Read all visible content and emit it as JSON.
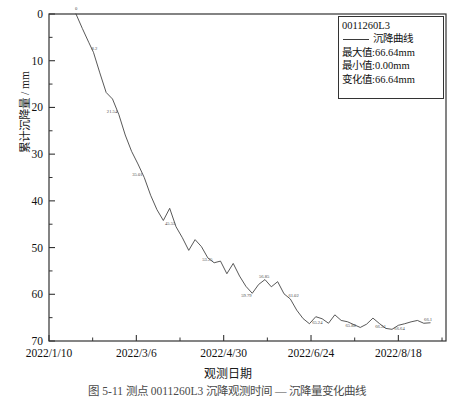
{
  "chart_data": {
    "type": "line",
    "title": "",
    "xlabel": "观测日期",
    "ylabel": "累计沉降量 / mm",
    "y_inverted": true,
    "ylim": [
      0,
      70
    ],
    "grid": false,
    "y_ticks": [
      "0",
      "10",
      "20",
      "30",
      "40",
      "50",
      "60",
      "70"
    ],
    "y_tick_values": [
      0,
      10,
      20,
      30,
      40,
      50,
      60,
      70
    ],
    "x_ticks": [
      "2022/1/10",
      "2022/3/6",
      "2022/4/30",
      "2022/6/24",
      "2022/8/18"
    ],
    "x_tick_days": [
      0,
      55,
      110,
      165,
      220
    ],
    "x_range_days": [
      0,
      250
    ],
    "series": [
      {
        "name": "沉降曲线",
        "color": "#3a3a3a",
        "x": [
          17,
          21,
          25,
          28,
          32,
          36,
          40,
          44,
          48,
          52,
          56,
          60,
          64,
          68,
          72,
          76,
          80,
          84,
          88,
          92,
          96,
          100,
          104,
          108,
          112,
          116,
          120,
          124,
          128,
          132,
          136,
          140,
          144,
          148,
          152,
          156,
          160,
          164,
          168,
          172,
          176,
          180,
          184,
          188,
          192,
          196,
          200,
          204,
          208,
          212,
          216,
          220,
          224,
          228,
          232,
          236,
          240
        ],
        "values": [
          0.0,
          3.1,
          6.05,
          8.2,
          12.6,
          16.8,
          18.2,
          21.54,
          25.9,
          29.4,
          32.1,
          35.01,
          38.8,
          41.9,
          44.2,
          41.6,
          45.55,
          47.9,
          50.6,
          48.3,
          49.8,
          52.2,
          53.25,
          52.9,
          55.6,
          53.4,
          56.1,
          58.3,
          59.79,
          57.9,
          56.85,
          58.4,
          57.3,
          59.9,
          61.02,
          63.4,
          65.2,
          66.3,
          64.8,
          65.24,
          66.2,
          64.4,
          65.6,
          65.88,
          66.5,
          67.1,
          66.4,
          65.1,
          66.24,
          67.3,
          67.5,
          66.64,
          66.3,
          65.9,
          65.6,
          66.2,
          66.1
        ]
      }
    ],
    "point_labels": [
      {
        "text": "0",
        "x": 17,
        "y": 0.0,
        "dx": -1,
        "dy": -4
      },
      {
        "text": "8.2",
        "x": 28,
        "y": 8.2,
        "dx": -2,
        "dy": -2
      },
      {
        "text": "21.54",
        "x": 44,
        "y": 21.54,
        "dx": -12,
        "dy": -2
      },
      {
        "text": "35.01",
        "x": 60,
        "y": 35.01,
        "dx": -12,
        "dy": -2
      },
      {
        "text": "45.55",
        "x": 80,
        "y": 45.55,
        "dx": -11,
        "dy": -2
      },
      {
        "text": "53.25",
        "x": 104,
        "y": 53.25,
        "dx": -12,
        "dy": -2
      },
      {
        "text": "59.79",
        "x": 128,
        "y": 59.79,
        "dx": -11,
        "dy": 4
      },
      {
        "text": "56.85",
        "x": 136,
        "y": 56.85,
        "dx": -6,
        "dy": -2
      },
      {
        "text": "61.02",
        "x": 152,
        "y": 61.02,
        "dx": -2,
        "dy": -2
      },
      {
        "text": "65.24",
        "x": 172,
        "y": 65.24,
        "dx": -10,
        "dy": 5
      },
      {
        "text": "65.88",
        "x": 188,
        "y": 65.88,
        "dx": -2,
        "dy": 5
      },
      {
        "text": "66.24",
        "x": 208,
        "y": 66.24,
        "dx": -4,
        "dy": 5
      },
      {
        "text": "66.64",
        "x": 220,
        "y": 66.64,
        "dx": -4,
        "dy": 5
      },
      {
        "text": "66.1",
        "x": 240,
        "y": 66.1,
        "dx": -6,
        "dy": -2
      }
    ]
  },
  "legend": {
    "id_label": "0011260L3",
    "series_label": "沉降曲线",
    "max_label": "最大值:66.64mm",
    "min_label": "最小值:0.00mm",
    "change_label": "变化值:66.64mm"
  },
  "axes": {
    "x_title": "观测日期",
    "y_title": "累计沉降量 / mm"
  },
  "caption": "图 5-11   测点 0011260L3 沉降观测时间 — 沉降量变化曲线"
}
